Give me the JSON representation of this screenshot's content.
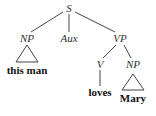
{
  "tree": {
    "root": "S",
    "children": {
      "subject_np": {
        "label": "NP",
        "leaf": "this man",
        "collapsed": true
      },
      "aux": {
        "label": "Aux"
      },
      "vp": {
        "label": "VP",
        "verb": {
          "label": "V",
          "leaf": "loves"
        },
        "object_np": {
          "label": "NP",
          "leaf": "Mary",
          "collapsed": true
        }
      }
    }
  },
  "colors": {
    "text": "#333333",
    "lines": "#444444",
    "background": "#ffffff"
  }
}
